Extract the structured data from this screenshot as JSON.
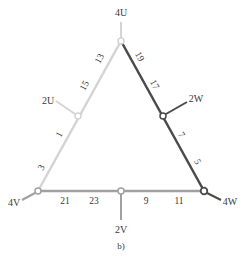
{
  "figure": {
    "caption": "b)",
    "colors": {
      "phase_u": "#d4d4d4",
      "phase_v": "#a0a0a0",
      "phase_w": "#4a4a4a",
      "text": "#3a3a3a"
    },
    "terminals": {
      "top": "4U",
      "left": "4V",
      "right": "4W",
      "left_mid": "2U",
      "right_mid": "2W",
      "bottom_mid": "2V"
    },
    "left_side_numbers": [
      "13",
      "15",
      "1",
      "3"
    ],
    "right_side_numbers": [
      "19",
      "17",
      "7",
      "5"
    ],
    "bottom_side_numbers": [
      "21",
      "23",
      "9",
      "11"
    ]
  }
}
